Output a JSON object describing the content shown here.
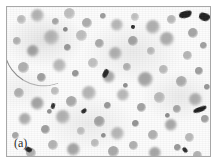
{
  "figure": {
    "domain": "micrograph",
    "panel_label": "(a)",
    "modality": "light-microscopy grayscale micrograph",
    "frame": {
      "border_color": "#a8a8a8",
      "margin_color": "#ffffff",
      "field_background": "#fcfcfc"
    },
    "palette": {
      "background": "#fcfcfc",
      "cell_light": "#d6d6d6",
      "cell_mid": "#b4b4b4",
      "cell_dark": "#8a8a8a",
      "nucleus_dark": "#5a5a5a",
      "debris_black": "#1d1d1d",
      "label_text": "#2b2b2b"
    },
    "features": {
      "fiber_streak": "curved thin fiber artifact at left-center",
      "debris_clusters": "sharp dark angular particles at top-right, right-center, center"
    },
    "cells": [
      {
        "x": 14,
        "y": 12,
        "d": 9,
        "tone": "#c2c2c2",
        "core": 0.45
      },
      {
        "x": 30,
        "y": 8,
        "d": 13,
        "tone": "#b6b6b6",
        "core": 0.5
      },
      {
        "x": 48,
        "y": 14,
        "d": 7,
        "tone": "#a8a8a8",
        "core": 0.55
      },
      {
        "x": 62,
        "y": 6,
        "d": 11,
        "tone": "#c0c0c0",
        "core": 0.4
      },
      {
        "x": 80,
        "y": 16,
        "d": 10,
        "tone": "#aeaeae",
        "core": 0.52
      },
      {
        "x": 96,
        "y": 9,
        "d": 6,
        "tone": "#9a9a9a",
        "core": 0.6
      },
      {
        "x": 110,
        "y": 18,
        "d": 12,
        "tone": "#b8b8b8",
        "core": 0.45
      },
      {
        "x": 128,
        "y": 10,
        "d": 8,
        "tone": "#c6c6c6",
        "core": 0.42
      },
      {
        "x": 146,
        "y": 20,
        "d": 14,
        "tone": "#b0b0b0",
        "core": 0.5
      },
      {
        "x": 164,
        "y": 12,
        "d": 9,
        "tone": "#bcbcbc",
        "core": 0.46
      },
      {
        "x": 186,
        "y": 26,
        "d": 10,
        "tone": "#a6a6a6",
        "core": 0.55
      },
      {
        "x": 10,
        "y": 34,
        "d": 8,
        "tone": "#b4b4b4",
        "core": 0.48
      },
      {
        "x": 26,
        "y": 44,
        "d": 12,
        "tone": "#a2a2a2",
        "core": 0.58
      },
      {
        "x": 44,
        "y": 30,
        "d": 15,
        "tone": "#b8b8b8",
        "core": 0.44
      },
      {
        "x": 60,
        "y": 40,
        "d": 7,
        "tone": "#989898",
        "core": 0.62
      },
      {
        "x": 74,
        "y": 28,
        "d": 11,
        "tone": "#c0c0c0",
        "core": 0.4
      },
      {
        "x": 92,
        "y": 36,
        "d": 9,
        "tone": "#aaaaaa",
        "core": 0.52
      },
      {
        "x": 108,
        "y": 46,
        "d": 13,
        "tone": "#b2b2b2",
        "core": 0.48
      },
      {
        "x": 126,
        "y": 34,
        "d": 10,
        "tone": "#a4a4a4",
        "core": 0.56
      },
      {
        "x": 144,
        "y": 44,
        "d": 8,
        "tone": "#bebebe",
        "core": 0.42
      },
      {
        "x": 160,
        "y": 32,
        "d": 14,
        "tone": "#acacac",
        "core": 0.5
      },
      {
        "x": 180,
        "y": 48,
        "d": 9,
        "tone": "#b6b6b6",
        "core": 0.46
      },
      {
        "x": 196,
        "y": 38,
        "d": 7,
        "tone": "#9e9e9e",
        "core": 0.58
      },
      {
        "x": 16,
        "y": 60,
        "d": 11,
        "tone": "#b0b0b0",
        "core": 0.5
      },
      {
        "x": 34,
        "y": 70,
        "d": 9,
        "tone": "#a0a0a0",
        "core": 0.6
      },
      {
        "x": 52,
        "y": 58,
        "d": 13,
        "tone": "#bababa",
        "core": 0.44
      },
      {
        "x": 68,
        "y": 66,
        "d": 7,
        "tone": "#949494",
        "core": 0.64
      },
      {
        "x": 86,
        "y": 56,
        "d": 10,
        "tone": "#c2c2c2",
        "core": 0.38
      },
      {
        "x": 102,
        "y": 70,
        "d": 12,
        "tone": "#a8a8a8",
        "core": 0.54
      },
      {
        "x": 120,
        "y": 60,
        "d": 8,
        "tone": "#b4b4b4",
        "core": 0.48
      },
      {
        "x": 138,
        "y": 72,
        "d": 15,
        "tone": "#a6a6a6",
        "core": 0.56
      },
      {
        "x": 156,
        "y": 62,
        "d": 9,
        "tone": "#bcbcbc",
        "core": 0.42
      },
      {
        "x": 174,
        "y": 74,
        "d": 11,
        "tone": "#aeaeae",
        "core": 0.52
      },
      {
        "x": 192,
        "y": 64,
        "d": 8,
        "tone": "#9c9c9c",
        "core": 0.58
      },
      {
        "x": 12,
        "y": 86,
        "d": 10,
        "tone": "#b2b2b2",
        "core": 0.5
      },
      {
        "x": 30,
        "y": 96,
        "d": 13,
        "tone": "#a4a4a4",
        "core": 0.56
      },
      {
        "x": 48,
        "y": 84,
        "d": 8,
        "tone": "#c0c0c0",
        "core": 0.4
      },
      {
        "x": 64,
        "y": 94,
        "d": 11,
        "tone": "#aaaaaa",
        "core": 0.54
      },
      {
        "x": 82,
        "y": 86,
        "d": 14,
        "tone": "#b6b6b6",
        "core": 0.46
      },
      {
        "x": 100,
        "y": 98,
        "d": 7,
        "tone": "#969696",
        "core": 0.62
      },
      {
        "x": 116,
        "y": 88,
        "d": 12,
        "tone": "#b8b8b8",
        "core": 0.44
      },
      {
        "x": 134,
        "y": 100,
        "d": 9,
        "tone": "#a2a2a2",
        "core": 0.58
      },
      {
        "x": 152,
        "y": 90,
        "d": 11,
        "tone": "#bcbcbc",
        "core": 0.42
      },
      {
        "x": 170,
        "y": 102,
        "d": 8,
        "tone": "#a8a8a8",
        "core": 0.55
      },
      {
        "x": 188,
        "y": 92,
        "d": 13,
        "tone": "#b0b0b0",
        "core": 0.5
      },
      {
        "x": 18,
        "y": 112,
        "d": 12,
        "tone": "#aeaeae",
        "core": 0.52
      },
      {
        "x": 38,
        "y": 122,
        "d": 9,
        "tone": "#9e9e9e",
        "core": 0.6
      },
      {
        "x": 56,
        "y": 110,
        "d": 14,
        "tone": "#b4b4b4",
        "core": 0.48
      },
      {
        "x": 74,
        "y": 124,
        "d": 8,
        "tone": "#c2c2c2",
        "core": 0.38
      },
      {
        "x": 92,
        "y": 114,
        "d": 11,
        "tone": "#a6a6a6",
        "core": 0.56
      },
      {
        "x": 110,
        "y": 126,
        "d": 13,
        "tone": "#b8b8b8",
        "core": 0.44
      },
      {
        "x": 128,
        "y": 116,
        "d": 7,
        "tone": "#929292",
        "core": 0.66
      },
      {
        "x": 146,
        "y": 128,
        "d": 10,
        "tone": "#b2b2b2",
        "core": 0.5
      },
      {
        "x": 164,
        "y": 118,
        "d": 12,
        "tone": "#a8a8a8",
        "core": 0.54
      },
      {
        "x": 182,
        "y": 130,
        "d": 9,
        "tone": "#bababa",
        "core": 0.42
      },
      {
        "x": 198,
        "y": 112,
        "d": 8,
        "tone": "#a0a0a0",
        "core": 0.58
      },
      {
        "x": 46,
        "y": 138,
        "d": 10,
        "tone": "#b6b6b6",
        "core": 0.48
      },
      {
        "x": 66,
        "y": 142,
        "d": 13,
        "tone": "#a4a4a4",
        "core": 0.56
      },
      {
        "x": 88,
        "y": 136,
        "d": 8,
        "tone": "#bebebe",
        "core": 0.4
      },
      {
        "x": 106,
        "y": 144,
        "d": 11,
        "tone": "#aaaaaa",
        "core": 0.54
      },
      {
        "x": 126,
        "y": 138,
        "d": 9,
        "tone": "#b0b0b0",
        "core": 0.5
      },
      {
        "x": 148,
        "y": 146,
        "d": 12,
        "tone": "#a6a6a6",
        "core": 0.55
      },
      {
        "x": 170,
        "y": 140,
        "d": 7,
        "tone": "#989898",
        "core": 0.62
      },
      {
        "x": 190,
        "y": 148,
        "d": 9,
        "tone": "#b4b4b4",
        "core": 0.48
      },
      {
        "x": 8,
        "y": 128,
        "d": 7,
        "tone": "#a8a8a8",
        "core": 0.55
      },
      {
        "x": 24,
        "y": 146,
        "d": 10,
        "tone": "#b2b2b2",
        "core": 0.5
      },
      {
        "x": 58,
        "y": 22,
        "d": 5,
        "tone": "#888888",
        "core": 0.7
      },
      {
        "x": 118,
        "y": 78,
        "d": 5,
        "tone": "#8c8c8c",
        "core": 0.68
      },
      {
        "x": 42,
        "y": 104,
        "d": 5,
        "tone": "#909090",
        "core": 0.66
      },
      {
        "x": 160,
        "y": 108,
        "d": 5,
        "tone": "#8a8a8a",
        "core": 0.7
      },
      {
        "x": 96,
        "y": 128,
        "d": 5,
        "tone": "#8e8e8e",
        "core": 0.68
      },
      {
        "x": 200,
        "y": 80,
        "d": 6,
        "tone": "#969696",
        "core": 0.64
      }
    ],
    "debris": [
      {
        "x": 172,
        "y": 4,
        "w": 13,
        "h": 7,
        "rot": -18,
        "tone": "#1f1f1f"
      },
      {
        "x": 192,
        "y": 6,
        "w": 11,
        "h": 8,
        "rot": 12,
        "tone": "#232323"
      },
      {
        "x": 186,
        "y": 100,
        "w": 14,
        "h": 5,
        "rot": -22,
        "tone": "#1d1d1d"
      },
      {
        "x": 96,
        "y": 62,
        "w": 5,
        "h": 9,
        "rot": 26,
        "tone": "#262626"
      },
      {
        "x": 74,
        "y": 102,
        "w": 6,
        "h": 4,
        "rot": -35,
        "tone": "#2a2a2a"
      },
      {
        "x": 44,
        "y": 96,
        "w": 4,
        "h": 6,
        "rot": 15,
        "tone": "#303030"
      },
      {
        "x": 176,
        "y": 140,
        "w": 4,
        "h": 6,
        "rot": -40,
        "tone": "#2c2c2c"
      },
      {
        "x": 18,
        "y": 140,
        "w": 7,
        "h": 5,
        "rot": 20,
        "tone": "#242424"
      },
      {
        "x": 206,
        "y": 128,
        "w": 4,
        "h": 4,
        "rot": 0,
        "tone": "#303030"
      },
      {
        "x": 124,
        "y": 18,
        "w": 4,
        "h": 4,
        "rot": 0,
        "tone": "#2e2e2e"
      }
    ]
  }
}
